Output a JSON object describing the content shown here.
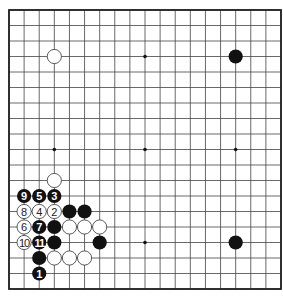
{
  "diagram": {
    "type": "go-board",
    "size": 19,
    "colors": {
      "background": "#ffffff",
      "line": "#444444",
      "border": "#222222",
      "black_stone": "#111111",
      "white_stone": "#ffffff",
      "white_stone_stroke": "#333333"
    },
    "star_points": [
      [
        3,
        9
      ],
      [
        9,
        3
      ],
      [
        9,
        9
      ],
      [
        15,
        9
      ],
      [
        3,
        15
      ],
      [
        9,
        15
      ],
      [
        15,
        15
      ],
      [
        3,
        3
      ],
      [
        15,
        3
      ]
    ],
    "stones": [
      {
        "color": "white",
        "col": 3,
        "row": 3,
        "label": ""
      },
      {
        "color": "black",
        "col": 15,
        "row": 3,
        "label": ""
      },
      {
        "color": "white",
        "col": 3,
        "row": 11,
        "label": ""
      },
      {
        "color": "black",
        "col": 1,
        "row": 12,
        "label": "9"
      },
      {
        "color": "black",
        "col": 2,
        "row": 12,
        "label": "5"
      },
      {
        "color": "black",
        "col": 3,
        "row": 12,
        "label": "3"
      },
      {
        "color": "white",
        "col": 1,
        "row": 13,
        "label": "8"
      },
      {
        "color": "white",
        "col": 2,
        "row": 13,
        "label": "4"
      },
      {
        "color": "white",
        "col": 3,
        "row": 13,
        "label": "2"
      },
      {
        "color": "black",
        "col": 4,
        "row": 13,
        "label": ""
      },
      {
        "color": "black",
        "col": 5,
        "row": 13,
        "label": ""
      },
      {
        "color": "white",
        "col": 1,
        "row": 14,
        "label": "6"
      },
      {
        "color": "black",
        "col": 2,
        "row": 14,
        "label": "7"
      },
      {
        "color": "black",
        "col": 3,
        "row": 14,
        "label": ""
      },
      {
        "color": "white",
        "col": 4,
        "row": 14,
        "label": ""
      },
      {
        "color": "white",
        "col": 5,
        "row": 14,
        "label": ""
      },
      {
        "color": "white",
        "col": 6,
        "row": 14,
        "label": ""
      },
      {
        "color": "white",
        "col": 1,
        "row": 15,
        "label": "10"
      },
      {
        "color": "black",
        "col": 2,
        "row": 15,
        "label": "11"
      },
      {
        "color": "black",
        "col": 3,
        "row": 15,
        "label": ""
      },
      {
        "color": "black",
        "col": 6,
        "row": 15,
        "label": ""
      },
      {
        "color": "black",
        "col": 15,
        "row": 15,
        "label": ""
      },
      {
        "color": "black",
        "col": 2,
        "row": 16,
        "label": ""
      },
      {
        "color": "white",
        "col": 3,
        "row": 16,
        "label": ""
      },
      {
        "color": "white",
        "col": 4,
        "row": 16,
        "label": ""
      },
      {
        "color": "white",
        "col": 5,
        "row": 16,
        "label": ""
      },
      {
        "color": "black",
        "col": 2,
        "row": 17,
        "label": "1"
      }
    ]
  }
}
